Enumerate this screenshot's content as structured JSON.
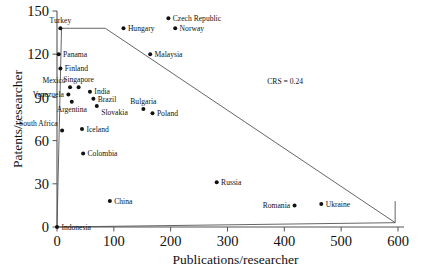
{
  "chart_data": {
    "type": "scatter",
    "title": "",
    "xlabel": "Publications/researcher",
    "ylabel": "Patents/researcher",
    "xlim": [
      0,
      600
    ],
    "ylim": [
      0,
      150
    ],
    "xticks": [
      0,
      100,
      200,
      300,
      400,
      500,
      600
    ],
    "yticks": [
      0,
      30,
      60,
      90,
      120,
      150
    ],
    "grid": false,
    "legend": false,
    "annotations": [
      {
        "text": "CRS = 0.24",
        "x": 370,
        "y": 99
      }
    ],
    "frontier": {
      "label": "CRS = 0.24",
      "upper_vertices": [
        [
          0,
          0
        ],
        [
          8,
          138
        ],
        [
          85,
          138
        ],
        [
          595,
          3
        ]
      ],
      "lower_vertices": [
        [
          0,
          0
        ],
        [
          595,
          3
        ]
      ],
      "closing_segment": [
        [
          595,
          3
        ],
        [
          595,
          18
        ]
      ]
    },
    "points": [
      {
        "name": "Turkey",
        "x": 6,
        "y": 138,
        "label_pos": "above"
      },
      {
        "name": "Panama",
        "x": 3,
        "y": 120,
        "label_pos": "right"
      },
      {
        "name": "Finland",
        "x": 6,
        "y": 110,
        "label_pos": "right"
      },
      {
        "name": "Mexico",
        "x": 23,
        "y": 97,
        "label_pos": "above-left"
      },
      {
        "name": "Singapore",
        "x": 38,
        "y": 97,
        "label_pos": "above"
      },
      {
        "name": "Venezuela",
        "x": 20,
        "y": 92,
        "label_pos": "left"
      },
      {
        "name": "Argentina",
        "x": 26,
        "y": 87,
        "label_pos": "below"
      },
      {
        "name": "India",
        "x": 58,
        "y": 94,
        "label_pos": "right"
      },
      {
        "name": "Brazil",
        "x": 64,
        "y": 89,
        "label_pos": "right"
      },
      {
        "name": "Slovakia",
        "x": 70,
        "y": 84,
        "label_pos": "below-right"
      },
      {
        "name": "Bulgaria",
        "x": 152,
        "y": 82,
        "label_pos": "above"
      },
      {
        "name": "Poland",
        "x": 168,
        "y": 79,
        "label_pos": "right"
      },
      {
        "name": "South Africa",
        "x": 9,
        "y": 67,
        "label_pos": "above-left"
      },
      {
        "name": "Iceland",
        "x": 44,
        "y": 68,
        "label_pos": "right"
      },
      {
        "name": "Colombia",
        "x": 46,
        "y": 51,
        "label_pos": "right"
      },
      {
        "name": "China",
        "x": 93,
        "y": 18,
        "label_pos": "right"
      },
      {
        "name": "Russia",
        "x": 281,
        "y": 31,
        "label_pos": "right"
      },
      {
        "name": "Romania",
        "x": 418,
        "y": 15,
        "label_pos": "left"
      },
      {
        "name": "Ukraine",
        "x": 465,
        "y": 16,
        "label_pos": "right"
      },
      {
        "name": "Hungary",
        "x": 117,
        "y": 138,
        "label_pos": "right"
      },
      {
        "name": "Czech Republic",
        "x": 196,
        "y": 145,
        "label_pos": "right"
      },
      {
        "name": "Norway",
        "x": 208,
        "y": 138,
        "label_pos": "right"
      },
      {
        "name": "Malaysia",
        "x": 164,
        "y": 120,
        "label_pos": "right"
      },
      {
        "name": "Indonesia",
        "x": 0,
        "y": 0,
        "label_pos": "right"
      }
    ]
  }
}
